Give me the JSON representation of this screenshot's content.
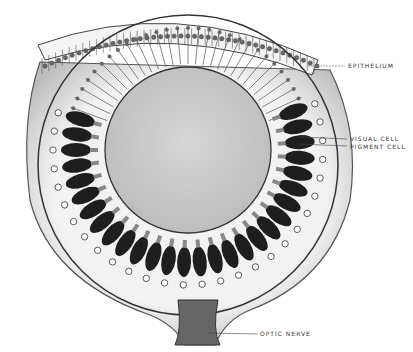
{
  "figure": {
    "labels": {
      "epithelium": "EPITHELIUM",
      "visual_cell": "VISUAL CELL",
      "pigment_cell": "PIGMENT CELL",
      "optic_nerve": "OPTIC NERVE"
    },
    "colors": {
      "background": "#ffffff",
      "lens_fill": "#cfcfcf",
      "ink": "#2a2a2a",
      "pigment": "#1e1e1e",
      "tissue": "#e6e6e6"
    }
  }
}
